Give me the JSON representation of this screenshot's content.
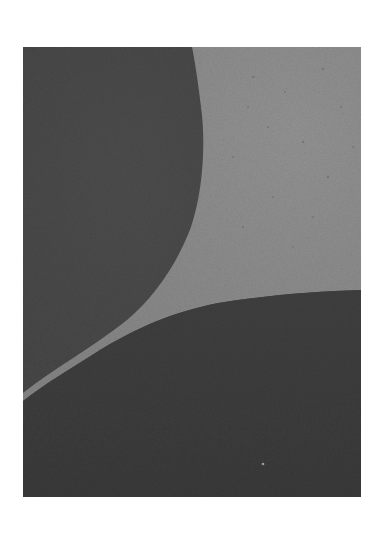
{
  "image": {
    "alt": "Abstract grayscale photograph: two dark curved regions separated by a tapering light-gray wedge",
    "colors": {
      "page_background": "#ffffff",
      "dark_region": "#474747",
      "light_region": "#8d8d8d"
    },
    "regions": [
      {
        "name": "upper-left-dark-curve",
        "tone": "dark"
      },
      {
        "name": "light-wedge",
        "tone": "light"
      },
      {
        "name": "lower-dark-curve",
        "tone": "dark"
      }
    ]
  }
}
